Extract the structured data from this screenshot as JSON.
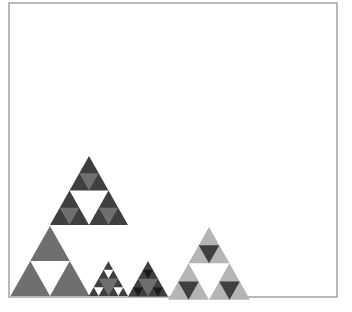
{
  "figure": {
    "frame": {
      "x": 9,
      "y": 3,
      "width": 328,
      "height": 294
    },
    "colors": {
      "dark": "#3f3f3f",
      "mid": "#6f6f6f",
      "light": "#b5b5b5",
      "black": "#1a1a1a",
      "white": "#ffffff",
      "frame": "#8a8a8a"
    },
    "shapes": [
      {
        "name": "large-sierpinski-top-block",
        "apex": [
          89,
          156
        ],
        "size": 78,
        "depth": 2,
        "fill": "dark",
        "hole": "white",
        "subhole": "mid"
      },
      {
        "name": "large-sierpinski-bottom-left-block",
        "apex": [
          50,
          226
        ],
        "size": 79,
        "depth": 1,
        "fill": "mid",
        "hole": "white"
      },
      {
        "name": "large-sierpinski-bottom-right-top",
        "apex": [
          128,
          226
        ],
        "size": 39.5,
        "depth": 2,
        "fill": "dark",
        "hole": "mid",
        "subhole": "light"
      },
      {
        "name": "large-sierpinski-bottom-right-left",
        "apex": [
          108.5,
          261
        ],
        "size": 39.5,
        "depth": 2,
        "fill": "dark",
        "hole": "mid",
        "subhole": "white"
      },
      {
        "name": "large-sierpinski-bottom-right-right",
        "apex": [
          148,
          261
        ],
        "size": 40,
        "depth": 2,
        "fill": "dark",
        "hole": "mid",
        "subhole": "black"
      },
      {
        "name": "large-sierpinski-bottom-right-center",
        "apex": [
          128,
          296
        ],
        "size": 39.5,
        "depth": 0,
        "fill": "white",
        "inverted": true
      },
      {
        "name": "small-sierpinski",
        "apex": [
          209,
          227
        ],
        "size": 82,
        "depth": 2,
        "fill": "light",
        "hole": "white",
        "subhole": "dark"
      }
    ]
  }
}
